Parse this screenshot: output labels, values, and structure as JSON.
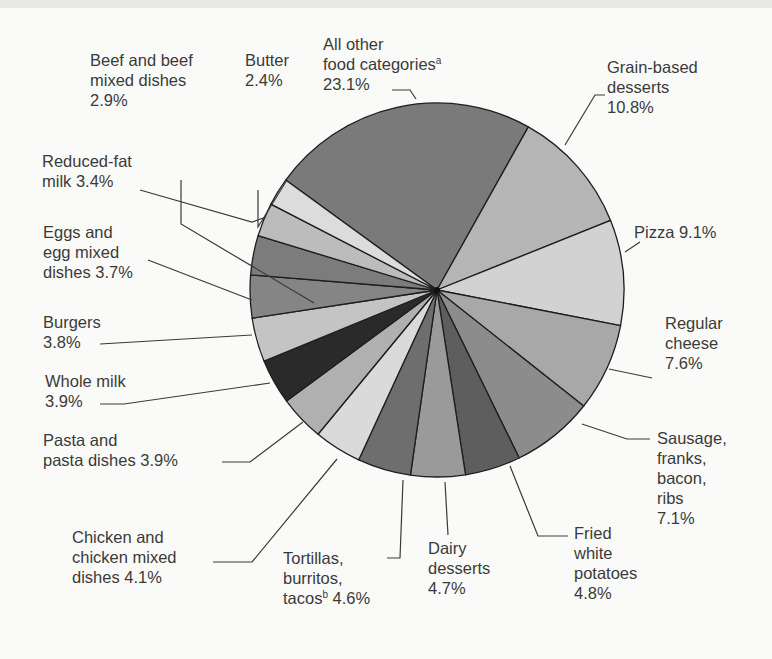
{
  "chart_data": {
    "type": "pie",
    "title": "",
    "center": [
      437,
      290
    ],
    "radius": 187,
    "start_angle_deg": 306,
    "slices": [
      {
        "label": "All other food categories",
        "footnote": "a",
        "value": 23.1,
        "color": "#7a7a7a"
      },
      {
        "label": "Grain-based desserts",
        "value": 10.8,
        "color": "#b5b5b5"
      },
      {
        "label": "Pizza",
        "value": 9.1,
        "color": "#d2d2d2"
      },
      {
        "label": "Regular cheese",
        "value": 7.6,
        "color": "#a8a8a8"
      },
      {
        "label": "Sausage, franks, bacon, ribs",
        "value": 7.1,
        "color": "#8c8c8c"
      },
      {
        "label": "Fried white potatoes",
        "value": 4.8,
        "color": "#5e5e5e"
      },
      {
        "label": "Dairy desserts",
        "value": 4.7,
        "color": "#9a9a9a"
      },
      {
        "label": "Tortillas, burritos, tacos",
        "footnote": "b",
        "value": 4.6,
        "color": "#6e6e6e"
      },
      {
        "label": "Chicken and chicken mixed dishes",
        "value": 4.1,
        "color": "#dadada"
      },
      {
        "label": "Pasta and pasta dishes",
        "value": 3.9,
        "color": "#b0b0b0"
      },
      {
        "label": "Whole milk",
        "value": 3.9,
        "color": "#2a2a2a"
      },
      {
        "label": "Burgers",
        "value": 3.8,
        "color": "#c4c4c4"
      },
      {
        "label": "Eggs and egg mixed dishes",
        "value": 3.7,
        "color": "#858585"
      },
      {
        "label": "Reduced-fat milk",
        "value": 3.4,
        "color": "#7c7c7c"
      },
      {
        "label": "Beef and beef mixed dishes",
        "value": 2.9,
        "color": "#bcbcbc"
      },
      {
        "label": "Butter",
        "value": 2.4,
        "color": "#dcdcdc"
      }
    ]
  },
  "labels": {
    "beef": {
      "l1": "Beef and beef",
      "l2": "mixed dishes",
      "l3": "2.9%"
    },
    "butter": {
      "l1": "Butter",
      "l2": "2.4%"
    },
    "other": {
      "l1": "All other",
      "l2": "food categories",
      "sup": "a",
      "l3": "23.1%"
    },
    "grain": {
      "l1": "Grain-based",
      "l2": "desserts",
      "l3": "10.8%"
    },
    "pizza": {
      "l1": "Pizza 9.1%"
    },
    "reduced": {
      "l1": "Reduced-fat",
      "l2": "milk 3.4%"
    },
    "eggs": {
      "l1": "Eggs and",
      "l2": "egg mixed",
      "l3": "dishes 3.7%"
    },
    "burgers": {
      "l1": "Burgers",
      "l2": "3.8%"
    },
    "wholemilk": {
      "l1": "Whole milk",
      "l2": "3.9%"
    },
    "pasta": {
      "l1": "Pasta and",
      "l2": "pasta dishes 3.9%"
    },
    "cheese": {
      "l1": "Regular",
      "l2": "cheese",
      "l3": "7.6%"
    },
    "sausage": {
      "l1": "Sausage,",
      "l2": "franks,",
      "l3": "bacon,",
      "l4": "ribs",
      "l5": "7.1%"
    },
    "fried": {
      "l1": "Fried",
      "l2": "white",
      "l3": "potatoes",
      "l4": "4.8%"
    },
    "dairy": {
      "l1": "Dairy",
      "l2": "desserts",
      "l3": "4.7%"
    },
    "tortillas": {
      "l1": "Tortillas,",
      "l2": "burritos,",
      "l3": "tacos",
      "sup": "b",
      "l4": "4.6%"
    },
    "chicken": {
      "l1": "Chicken and",
      "l2": "chicken mixed",
      "l3": "dishes 4.1%"
    }
  }
}
